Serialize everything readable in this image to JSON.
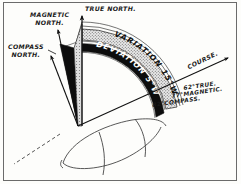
{
  "figure": {
    "kind": "navigation-compass-error-diagram",
    "background_color": "#fdfdfb",
    "ink_color": "#111111",
    "frame_color": "#6b6b6b"
  },
  "labels": {
    "magnetic_north_line1": "MAGNETIC",
    "magnetic_north_line2": "NORTH.",
    "compass_north_line1": "COMPASS",
    "compass_north_line2": "NORTH.",
    "true_north": "TRUE NORTH.",
    "course": "COURSE.",
    "course_true": "62°TRUE.",
    "course_magnetic": "77°MAGNETIC.",
    "course_compass": "82°COMPASS."
  },
  "arc_bands": {
    "variation_band_text": "VARIATION 15°W",
    "deviation_band_text": "DEVIATION 5°W",
    "variation_fill": "#c9c9c9",
    "deviation_fill": "#0d0d0d"
  },
  "values": {
    "variation_degrees": 15,
    "variation_direction": "W",
    "deviation_degrees": 5,
    "deviation_direction": "W",
    "true_course_degrees": 62,
    "magnetic_course_degrees": 77,
    "compass_course_degrees": 82
  },
  "elements": {
    "true_north_arrow": "true-north-arrow",
    "magnetic_north_arrow": "magnetic-north-arrow",
    "compass_north_arrow": "compass-north-arrow",
    "course_arrow": "course-arrow",
    "ship_hull": "ship-hull-outline",
    "compass_sector": "compass-error-sector",
    "dashed_extension": "dashed-course-extension"
  }
}
